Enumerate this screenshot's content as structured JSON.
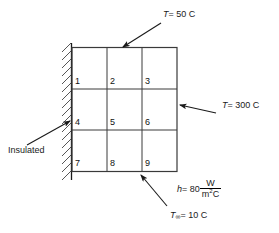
{
  "figure": {
    "grid": {
      "rows": 3,
      "cols": 3,
      "node_labels": [
        "1",
        "2",
        "3",
        "4",
        "5",
        "6",
        "7",
        "8",
        "9"
      ]
    },
    "boundaries": {
      "top": {
        "name": "top-temperature",
        "symbol": "T",
        "equals": "= 50 C",
        "full_text": "T = 50 C"
      },
      "right": {
        "name": "right-temperature",
        "symbol": "T",
        "equals": "= 300 C",
        "full_text": "T = 300 C"
      },
      "left": {
        "name": "left-insulated",
        "full_text": "Insulated"
      },
      "bottom": {
        "name": "bottom-convection",
        "symbol": "h",
        "equals": "= 80",
        "numerator": "W",
        "denominator_base": "m",
        "denominator_exp": "2",
        "denominator_tail": "C",
        "full_text": "h = 80 W/m2C",
        "ambient_symbol": "T",
        "ambient_subscript": "∞",
        "ambient_equals": "= 10 C",
        "ambient_full_text": "T∞ = 10 C"
      }
    },
    "colors": {
      "stroke": "#1a1a1a",
      "grid_line": "#3a3a3a",
      "background": "#ffffff",
      "text": "#111111"
    }
  }
}
